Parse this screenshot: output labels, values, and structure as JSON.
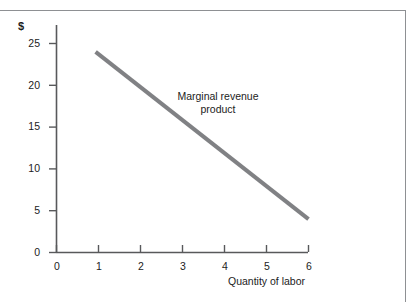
{
  "chart_data": {
    "type": "line",
    "title": "",
    "subtitle": "",
    "xlabel": "Quantity of labor",
    "ylabel": "$",
    "xlim": [
      0,
      6
    ],
    "ylim": [
      0,
      26
    ],
    "xticks": [
      "0",
      "1",
      "2",
      "3",
      "4",
      "5",
      "6"
    ],
    "yticks": [
      "0",
      "5",
      "10",
      "15",
      "20",
      "25"
    ],
    "grid": false,
    "legend_position": "none",
    "annotations": [
      {
        "name": "marginal-revenue-product",
        "line1": "Marginal revenue",
        "line2": "product"
      }
    ],
    "series": [
      {
        "name": "Marginal revenue product",
        "color": "#808184",
        "x": [
          0.93,
          6.0
        ],
        "values": [
          24,
          4
        ],
        "points": [
          {
            "x": 0.93,
            "y": 24
          },
          {
            "x": 6.0,
            "y": 4
          }
        ]
      }
    ]
  },
  "figure": {
    "unit_label": "$",
    "x_axis_title": "Quantity of labor",
    "x_tick_labels": [
      "0",
      "1",
      "2",
      "3",
      "4",
      "5",
      "6"
    ],
    "y_tick_labels": [
      "0",
      "5",
      "10",
      "15",
      "20",
      "25"
    ],
    "annotation": {
      "line1": "Marginal revenue",
      "line2": "product"
    },
    "colors": {
      "series": "#808184",
      "axis": "#58595b",
      "frame": "#8e9093",
      "text": "#1c1c1c",
      "background": "#ffffff"
    }
  }
}
